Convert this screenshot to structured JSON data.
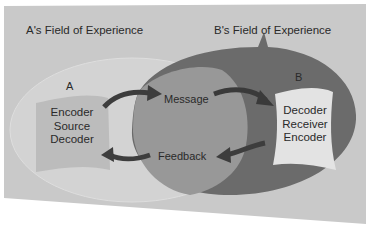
{
  "diagram": {
    "type": "transactional-communication-model",
    "fields": {
      "a_field_label": "A's Field of Experience",
      "b_field_label": "B's Field of Experience"
    },
    "participants": {
      "a": {
        "label": "A",
        "roles": [
          "Encoder",
          "Source",
          "Decoder"
        ]
      },
      "b": {
        "label": "B",
        "roles": [
          "Decoder",
          "Receiver",
          "Encoder"
        ]
      }
    },
    "flows": {
      "message": "Message",
      "feedback": "Feedback"
    },
    "colors": {
      "page_background": "#ffffff",
      "panel": "#c8c8c8",
      "a_field": "#d4d4d4",
      "b_field": "#6e6e6e",
      "overlap": "#9a9a9a",
      "a_box": "#bdbdbd",
      "b_box": "#e2e2e2",
      "arrows": "#3f3f3f"
    }
  }
}
